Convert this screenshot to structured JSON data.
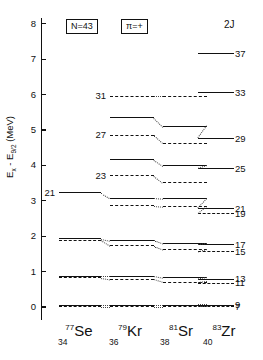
{
  "figure": {
    "y_axis_label": "Ex - E9/2 (MeV)",
    "y_axis_label_main": "E",
    "y_axis_sub1": "x",
    "y_axis_mid": " - E",
    "y_axis_sub2": "9/2",
    "y_axis_unit": " (MeV)",
    "y_ticks": [
      "0",
      "1",
      "2",
      "3",
      "4",
      "5",
      "6",
      "7",
      "8"
    ],
    "y_min": 0,
    "y_max": 8,
    "header": {
      "neutron_number": "N=43",
      "parity": "π=+",
      "spin_column_header": "2J"
    },
    "columns": [
      {
        "mass": "77",
        "symbol": "Se",
        "z": "34"
      },
      {
        "mass": "79",
        "symbol": "Kr",
        "z": "36"
      },
      {
        "mass": "81",
        "symbol": "Sr",
        "z": "38"
      },
      {
        "mass": "83",
        "symbol": "Zr",
        "z": "40"
      }
    ],
    "right_labels": [
      "37",
      "33",
      "29",
      "25",
      "21",
      "19",
      "17",
      "15",
      "13",
      "11",
      "9",
      "7"
    ],
    "inner_labels": [
      "31",
      "27",
      "23",
      "21"
    ]
  },
  "chart_data": {
    "type": "line",
    "xlabel": "",
    "ylabel": "Ex - E9/2 (MeV)",
    "ylim": [
      0,
      8
    ],
    "grid": false,
    "legend": "none",
    "categories": [
      "77Se",
      "79Kr",
      "81Sr",
      "83Zr"
    ],
    "note": "Each series is a band of constant 2J. Solid lines = 2J in the 9,13,17,21,25,29,33,37 sequence; dashed lines = 2J in the 7,11,15,19,23,27,31 sequence. Dotted diagonals connect the same 2J across neighbouring isotones. Values in MeV relative to the 9/2+ bandhead. null = level not drawn for that isotone.",
    "series": [
      {
        "name": "2J=37",
        "style": "solid",
        "label_side": "right",
        "values": [
          null,
          null,
          null,
          7.15
        ]
      },
      {
        "name": "2J=33",
        "style": "solid",
        "label_side": "right",
        "values": [
          null,
          null,
          null,
          6.05
        ]
      },
      {
        "name": "2J=31",
        "style": "dashed",
        "label_side": "left",
        "values": [
          null,
          5.95,
          5.95,
          null
        ]
      },
      {
        "name": "2J=29",
        "style": "solid",
        "label_side": "right",
        "values": [
          null,
          5.35,
          5.1,
          4.75
        ]
      },
      {
        "name": "2J=27",
        "style": "dashed",
        "label_side": "left",
        "values": [
          null,
          4.85,
          4.62,
          null
        ]
      },
      {
        "name": "2J=25",
        "style": "solid",
        "label_side": "right",
        "values": [
          null,
          4.15,
          3.98,
          3.9
        ]
      },
      {
        "name": "2J=23",
        "style": "dashed",
        "label_side": "left",
        "values": [
          null,
          3.7,
          3.5,
          null
        ]
      },
      {
        "name": "2J=21",
        "style": "solid",
        "label_side": "both",
        "values": [
          3.22,
          3.07,
          3.05,
          2.78
        ]
      },
      {
        "name": "2J=19",
        "style": "dashed",
        "label_side": "right",
        "values": [
          null,
          2.85,
          2.83,
          2.63
        ]
      },
      {
        "name": "2J=17",
        "style": "solid",
        "label_side": "right",
        "values": [
          1.93,
          1.88,
          1.78,
          1.75
        ]
      },
      {
        "name": "2J=15",
        "style": "dashed",
        "label_side": "right",
        "values": [
          1.88,
          1.72,
          1.62,
          1.55
        ]
      },
      {
        "name": "2J=13",
        "style": "solid",
        "label_side": "right",
        "values": [
          0.87,
          0.87,
          0.82,
          0.78
        ]
      },
      {
        "name": "2J=11",
        "style": "dashed",
        "label_side": "right",
        "values": [
          0.82,
          0.78,
          0.7,
          0.67
        ]
      },
      {
        "name": "2J=9",
        "style": "solid",
        "label_side": "right",
        "values": [
          0.05,
          0.05,
          0.05,
          0.05
        ]
      },
      {
        "name": "2J=7",
        "style": "dashed",
        "label_side": "right",
        "values": [
          0.0,
          0.0,
          0.0,
          0.0
        ]
      }
    ]
  }
}
